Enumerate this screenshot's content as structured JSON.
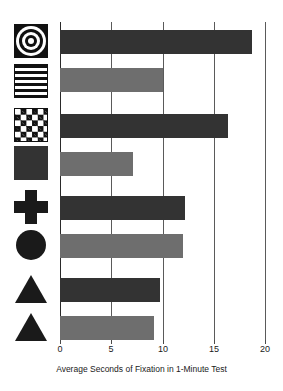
{
  "chart_data": {
    "type": "bar",
    "orientation": "horizontal",
    "title": "",
    "xlabel": "Average Seconds of Fixation in 1-Minute Test",
    "ylabel": "",
    "xlim": [
      0,
      20
    ],
    "xticks": [
      0,
      5,
      10,
      15,
      20
    ],
    "xtick_labels": [
      "0",
      "5",
      "10",
      "15",
      "20"
    ],
    "grid": true,
    "legend": "none",
    "categories": [
      "bullseye",
      "horizontal-stripes",
      "checkerboard",
      "solid-square",
      "cross",
      "circle",
      "triangle-dark",
      "triangle-light"
    ],
    "values": [
      18.6,
      10.0,
      16.3,
      7.1,
      12.1,
      11.9,
      9.7,
      9.1
    ],
    "bars": [
      {
        "icon": "bullseye-icon",
        "label": "Bullseye",
        "value": 18.6,
        "color": "#333333",
        "shade": "dark"
      },
      {
        "icon": "horizontal-stripes-icon",
        "label": "Horizontal Stripes",
        "value": 10.0,
        "color": "#6e6e6e",
        "shade": "light"
      },
      {
        "icon": "checkerboard-icon",
        "label": "Checkerboard",
        "value": 16.3,
        "color": "#333333",
        "shade": "dark"
      },
      {
        "icon": "solid-square-icon",
        "label": "Solid Square",
        "value": 7.1,
        "color": "#6e6e6e",
        "shade": "light"
      },
      {
        "icon": "cross-icon",
        "label": "Cross",
        "value": 12.1,
        "color": "#333333",
        "shade": "dark"
      },
      {
        "icon": "circle-icon",
        "label": "Circle",
        "value": 11.9,
        "color": "#6e6e6e",
        "shade": "light"
      },
      {
        "icon": "triangle-icon",
        "label": "Triangle",
        "value": 9.7,
        "color": "#333333",
        "shade": "dark"
      },
      {
        "icon": "triangle-icon",
        "label": "Triangle",
        "value": 9.1,
        "color": "#6e6e6e",
        "shade": "light"
      }
    ],
    "colors": {
      "dark_bar": "#333333",
      "light_bar": "#6e6e6e",
      "gridline": "#5a5a5a",
      "background": "#ffffff",
      "text": "#1a1a1a"
    }
  },
  "axis": {
    "title": "Average Seconds of Fixation in 1-Minute Test",
    "ticks": [
      "0",
      "5",
      "10",
      "15",
      "20"
    ]
  }
}
